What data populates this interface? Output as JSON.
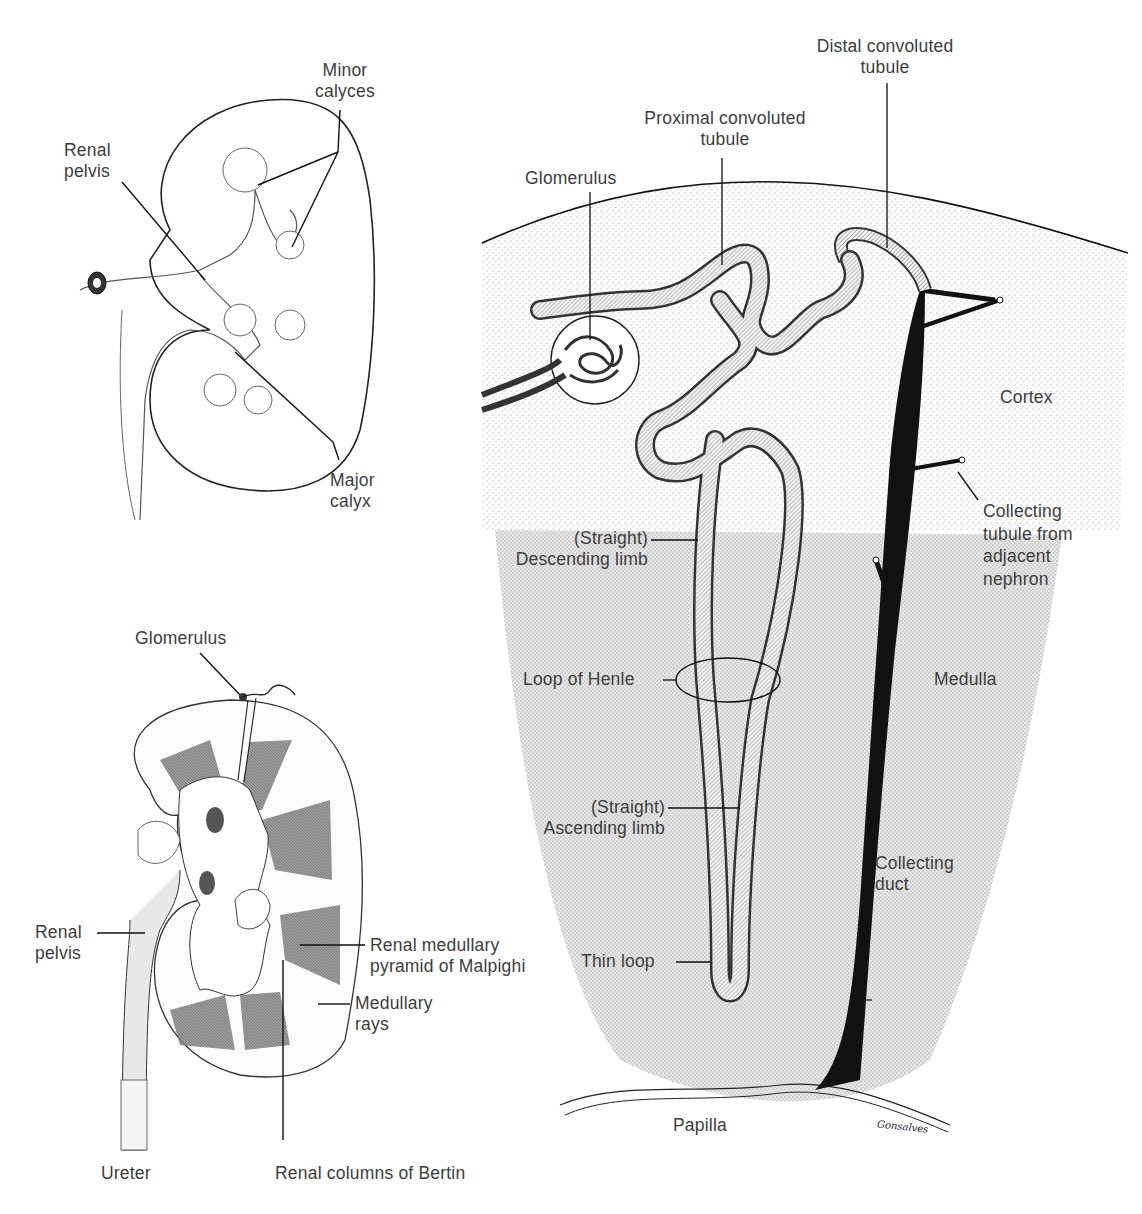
{
  "figure": {
    "panels": [
      {
        "id": "kidney-collecting-system",
        "labels": {
          "minor_calyces_1": "Minor",
          "minor_calyces_2": "calyces",
          "renal_pelvis_1": "Renal",
          "renal_pelvis_2": "pelvis",
          "major_calyx_1": "Major",
          "major_calyx_2": "calyx"
        }
      },
      {
        "id": "kidney-section",
        "labels": {
          "glomerulus": "Glomerulus",
          "renal_pelvis_1": "Renal",
          "renal_pelvis_2": "pelvis",
          "pyramid_1": "Renal medullary",
          "pyramid_2": "pyramid of Malpighi",
          "rays_1": "Medullary",
          "rays_2": "rays",
          "ureter": "Ureter",
          "columns": "Renal columns of Bertin"
        }
      },
      {
        "id": "nephron",
        "labels": {
          "distal_1": "Distal convoluted",
          "distal_2": "tubule",
          "proximal_1": "Proximal convoluted",
          "proximal_2": "tubule",
          "glomerulus": "Glomerulus",
          "cortex": "Cortex",
          "collecting_tubule_1": "Collecting",
          "collecting_tubule_2": "tubule from",
          "collecting_tubule_3": "adjacent",
          "collecting_tubule_4": "nephron",
          "descending_1": "(Straight)",
          "descending_2": "Descending limb",
          "loop_of_henle": "Loop of Henle",
          "medulla": "Medulla",
          "ascending_1": "(Straight)",
          "ascending_2": "Ascending limb",
          "collecting_duct_1": "Collecting",
          "collecting_duct_2": "duct",
          "thin_loop": "Thin loop",
          "papilla": "Papilla",
          "signature": "Gonsalves"
        }
      }
    ]
  }
}
